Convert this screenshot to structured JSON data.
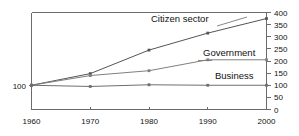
{
  "chart_data": {
    "type": "line",
    "title": "",
    "subtitle": "",
    "xlabel": "",
    "ylabel": "",
    "x": [
      1960,
      1970,
      1980,
      1990,
      2000
    ],
    "categories": [
      "1960",
      "1970",
      "1980",
      "1990",
      "2000"
    ],
    "series": [
      {
        "name": "Citizen sector",
        "values": [
          100,
          148,
          245,
          315,
          375
        ],
        "color": "#555555"
      },
      {
        "name": "Government",
        "values": [
          100,
          140,
          160,
          205,
          205
        ],
        "color": "#808080"
      },
      {
        "name": "Business",
        "values": [
          100,
          95,
          102,
          100,
          100
        ],
        "color": "#6e6e6e"
      }
    ],
    "ylim": [
      0,
      400
    ],
    "xlim": [
      1960,
      2000
    ],
    "y_ticks": [
      0,
      50,
      100,
      150,
      200,
      250,
      300,
      350,
      400
    ],
    "y_tick_labels": [
      "0",
      "50",
      "100",
      "150",
      "200",
      "250",
      "300",
      "350",
      "400"
    ],
    "y_axis_position": "right",
    "x_tick_labels": [
      "1960",
      "1970",
      "1980",
      "1990",
      "2000"
    ],
    "left_axis_label": "100",
    "grid": false,
    "legend": "inline-labels",
    "legend_position": "inline"
  },
  "labels": {
    "citizen_sector": "Citizen sector",
    "government": "Government",
    "business": "Business",
    "left_baseline": "100"
  },
  "x_ticks": {
    "t0": "1960",
    "t1": "1970",
    "t2": "1980",
    "t3": "1990",
    "t4": "2000"
  },
  "y_ticks": {
    "y0": "0",
    "y1": "50",
    "y2": "100",
    "y3": "150",
    "y4": "200",
    "y5": "250",
    "y6": "300",
    "y7": "350",
    "y8": "400"
  },
  "colors": {
    "axis": "#6b6b6b",
    "text": "#111111",
    "citizen": "#555555",
    "government": "#808080",
    "business": "#6e6e6e",
    "background": "#ffffff"
  }
}
